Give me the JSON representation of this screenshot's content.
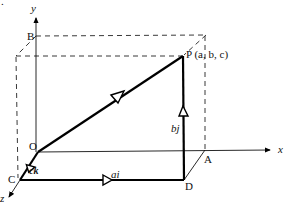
{
  "diagram": {
    "type": "3d-vector-path",
    "axes": {
      "x": "x",
      "y": "y",
      "z": "z"
    },
    "points": {
      "O": "O",
      "A": "A",
      "B": "B",
      "C": "C",
      "D": "D",
      "P": "P (a, b, c)"
    },
    "vectors": {
      "OC": "ck",
      "CD": "ai",
      "DP": "bj"
    },
    "corner_mark": "."
  }
}
